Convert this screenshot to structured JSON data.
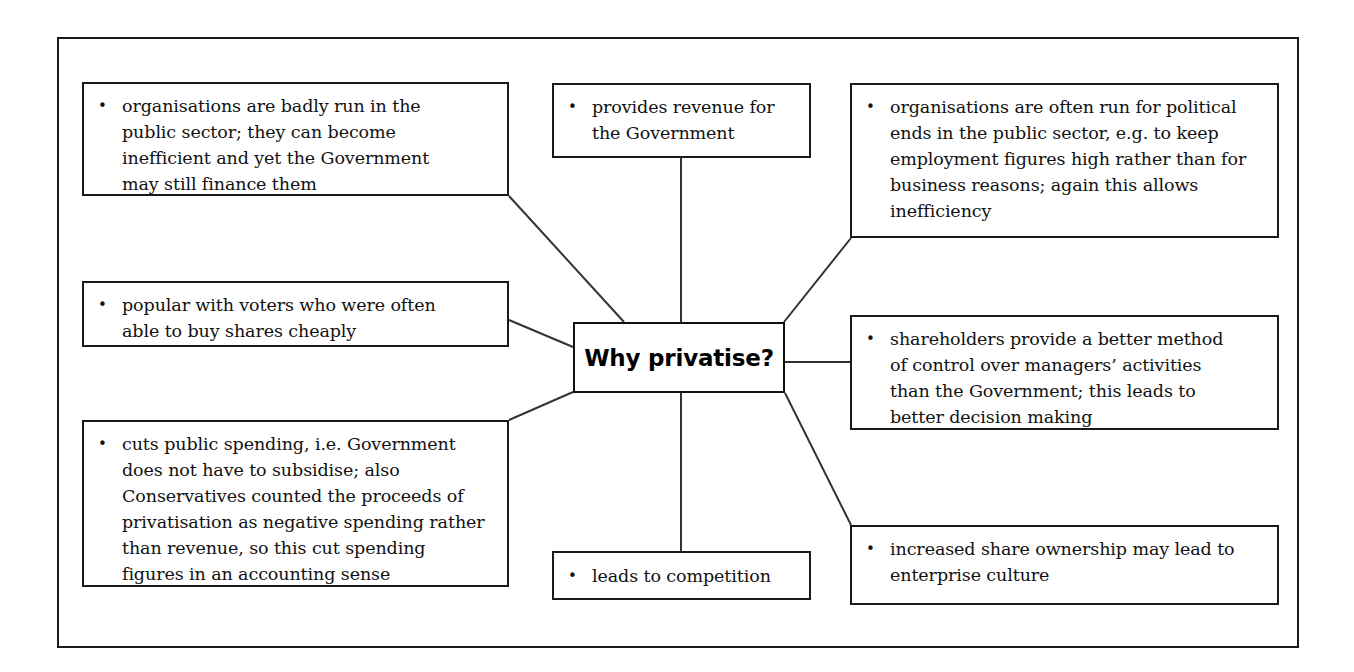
{
  "diagram": {
    "title": "Why privatise?",
    "center": {
      "label": "Why privatise?",
      "bullet": ""
    },
    "bullet_glyph": "•",
    "colors": {
      "border": "#1a1a1a",
      "text": "#111111",
      "background": "#ffffff",
      "connector": "#333333"
    },
    "nodes": [
      {
        "id": "badly-run",
        "bullet": "•",
        "text": "organisations are badly run in the\npublic sector; they can become\ninefficient and yet the Government\nmay still finance them"
      },
      {
        "id": "provides-revenue",
        "bullet": "•",
        "text": "provides revenue for\nthe Government"
      },
      {
        "id": "political-ends",
        "bullet": "•",
        "text": "organisations are often run for political\nends in the public sector, e.g. to keep\nemployment figures high rather than for\nbusiness reasons; again this allows\ninefficiency"
      },
      {
        "id": "popular-voters",
        "bullet": "•",
        "text": "popular with voters who were often\nable to buy shares cheaply"
      },
      {
        "id": "shareholders-control",
        "bullet": "•",
        "text": "shareholders provide a better method\nof control over managers’ activities\nthan the Government; this leads to\nbetter decision making"
      },
      {
        "id": "cuts-public-spending",
        "bullet": "•",
        "text": "cuts public spending, i.e. Government\ndoes not have to subsidise; also\nConservatives counted the proceeds of\nprivatisation as negative spending rather\nthan revenue, so this cut spending\nfigures in an accounting sense"
      },
      {
        "id": "leads-to-competition",
        "bullet": "•",
        "text": "leads to competition"
      },
      {
        "id": "share-ownership",
        "bullet": "•",
        "text": "increased share ownership may lead to\nenterprise culture"
      }
    ]
  }
}
